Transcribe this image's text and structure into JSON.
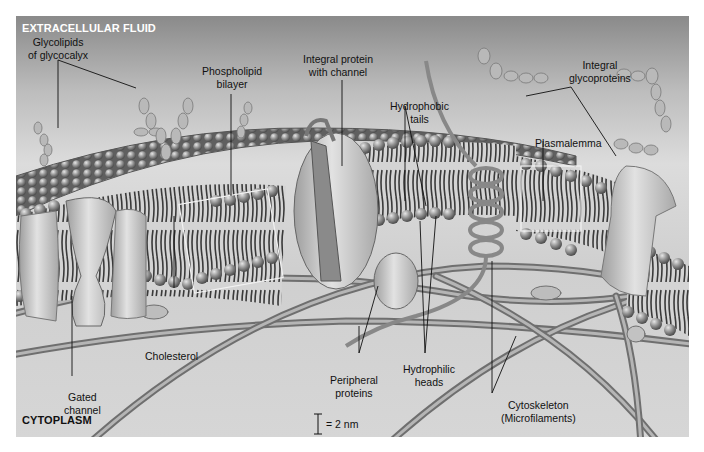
{
  "regions": {
    "top": "EXTRACELLULAR FLUID",
    "bottom": "CYTOPLASM"
  },
  "labels": [
    {
      "id": "glycolipids",
      "line1": "Glycolipids",
      "line2": "of glycocalyx"
    },
    {
      "id": "phospholipid-bilayer",
      "line1": "Phospholipid",
      "line2": "bilayer"
    },
    {
      "id": "integral-protein-channel",
      "line1": "Integral protein",
      "line2": "with channel"
    },
    {
      "id": "hydrophobic-tails",
      "line1": "Hydrophobic",
      "line2": "tails"
    },
    {
      "id": "integral-glycoproteins",
      "line1": "Integral",
      "line2": "glycoproteins"
    },
    {
      "id": "plasmalemma",
      "line1": "Plasmalemma",
      "line2": ""
    },
    {
      "id": "cholesterol",
      "line1": "Cholesterol",
      "line2": ""
    },
    {
      "id": "gated-channel",
      "line1": "Gated",
      "line2": "channel"
    },
    {
      "id": "peripheral-proteins",
      "line1": "Peripheral",
      "line2": "proteins"
    },
    {
      "id": "hydrophilic-heads",
      "line1": "Hydrophilic",
      "line2": "heads"
    },
    {
      "id": "cytoskeleton",
      "line1": "Cytoskeleton",
      "line2": "(Microfilaments)"
    }
  ],
  "scale": {
    "text": "= 2 nm"
  },
  "colors": {
    "membrane_head": "#8c8c8c",
    "protein": "#c8c8c8",
    "filament": "#9a9a9a",
    "label_line": "#111111",
    "region_top_text": "#ffffff",
    "region_bottom_text": "#111111"
  }
}
